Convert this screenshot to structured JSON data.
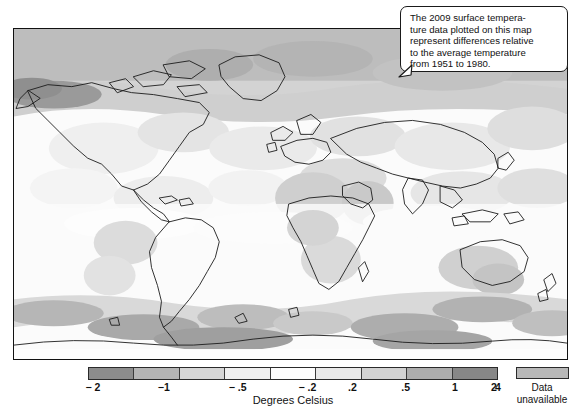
{
  "figure": {
    "title_hidden": "",
    "callout": {
      "text": "The 2009 surface tempera-\nture data plotted on this map\nrepresent differences relative\nto the average temperature\nfrom 1951 to 1980."
    }
  },
  "legend": {
    "axis_title": "Degrees Celsius",
    "ticks": [
      {
        "label": "− 2",
        "pos_pct": 1.2
      },
      {
        "label": "−1",
        "pos_pct": 18.5
      },
      {
        "label": "− .5",
        "pos_pct": 36.5
      },
      {
        "label": "− .2",
        "pos_pct": 53.5
      },
      {
        "label": ".2",
        "pos_pct": 64.5
      },
      {
        "label": ".5",
        "pos_pct": 77.5
      },
      {
        "label": "1",
        "pos_pct": 89.5
      },
      {
        "label": "2",
        "pos_pct": 99.0
      }
    ],
    "end_tick": {
      "label": "4",
      "pos_pct": 100
    },
    "swatches": [
      {
        "name": "band-lt-minus2",
        "range": "< -2",
        "color": "#8c8c8c"
      },
      {
        "name": "band-minus2-minus1",
        "range": "-2 to -1",
        "color": "#b5b5b5"
      },
      {
        "name": "band-minus1-minus05",
        "range": "-1 to -.5",
        "color": "#d6d6d6"
      },
      {
        "name": "band-minus05-minus02",
        "range": "-.5 to -.2",
        "color": "#efefef"
      },
      {
        "name": "band-minus02-02",
        "range": "-.2 to .2",
        "color": "#fdfdfd"
      },
      {
        "name": "band-02-05",
        "range": ".2 to .5",
        "color": "#e9e9e9"
      },
      {
        "name": "band-05-1",
        "range": ".5 to 1",
        "color": "#d2d2d2"
      },
      {
        "name": "band-1-2",
        "range": "1 to 2",
        "color": "#adadad"
      },
      {
        "name": "band-2-4",
        "range": "2 to 4",
        "color": "#878787"
      }
    ],
    "data_unavailable": {
      "label": "Data\nunavailable",
      "color": "#b8b8b8"
    }
  },
  "chart_data": {
    "type": "heatmap",
    "subtitle": "",
    "xlabel": "",
    "ylabel": "",
    "colorbar_label": "Degrees Celsius",
    "colorbar_ticks": [
      -2,
      -1,
      -0.5,
      -0.2,
      0.2,
      0.5,
      1,
      2,
      4
    ],
    "colorbar_tick_labels": [
      "− 2",
      "−1",
      "− .5",
      "− .2",
      ".2",
      ".5",
      "1",
      "2",
      "4"
    ],
    "colorbar_colors": [
      "#8c8c8c",
      "#b5b5b5",
      "#d6d6d6",
      "#efefef",
      "#fdfdfd",
      "#e9e9e9",
      "#d2d2d2",
      "#adadad",
      "#878787"
    ],
    "units": "degrees Celsius",
    "baseline_period": "1951 to 1980",
    "data_year": 2009,
    "legend_position": "bottom",
    "grid": false,
    "missing_data_color": "#b8b8b8",
    "missing_data_label": "Data unavailable",
    "annotations": [
      "The 2009 surface temperature data plotted on this map represent differences relative to the average temperature from 1951 to 1980."
    ],
    "regions": [
      {
        "name": "Arctic / northern high latitudes",
        "anomaly_band": "1 to 2"
      },
      {
        "name": "Alaska / Bering Sea",
        "anomaly_band": "2 to 4"
      },
      {
        "name": "North America interior",
        "anomaly_band": ".2 to .5"
      },
      {
        "name": "Equatorial Pacific",
        "anomaly_band": "-.2 to .2"
      },
      {
        "name": "Africa",
        "anomaly_band": "-.2 to .5"
      },
      {
        "name": "Australia",
        "anomaly_band": ".5 to 1"
      },
      {
        "name": "Southern Ocean",
        "anomaly_band": ".5 to 2"
      },
      {
        "name": "Antarctica",
        "anomaly_band": "Data unavailable"
      }
    ]
  }
}
